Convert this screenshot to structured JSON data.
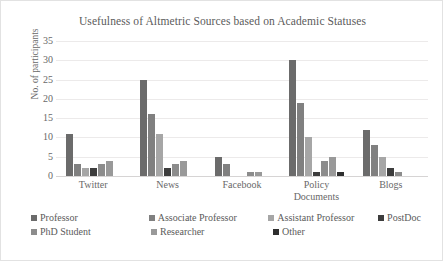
{
  "chart_data": {
    "type": "bar",
    "title": "Usefulness of Altmetric Sources based on Academic Statuses",
    "xlabel": "",
    "ylabel": "No. of participants",
    "ylim": [
      0,
      35
    ],
    "ytick_step": 5,
    "yticks": [
      "0",
      "5",
      "10",
      "15",
      "20",
      "25",
      "30",
      "35"
    ],
    "grid": true,
    "legend_position": "bottom",
    "categories": [
      "Twitter",
      "News",
      "Facebook",
      "Policy Documents",
      "Blogs"
    ],
    "category_lines": [
      [
        "Twitter"
      ],
      [
        "News"
      ],
      [
        "Facebook"
      ],
      [
        "Policy",
        "Documents"
      ],
      [
        "Blogs"
      ]
    ],
    "series": [
      {
        "name": "Professor",
        "color": "#6b6b6b",
        "values": [
          11,
          25,
          5,
          30,
          12
        ]
      },
      {
        "name": "Associate Professor",
        "color": "#808080",
        "values": [
          3,
          16,
          3,
          19,
          8
        ]
      },
      {
        "name": "Assistant Professor",
        "color": "#a6a6a6",
        "values": [
          2,
          11,
          0,
          10,
          5
        ]
      },
      {
        "name": "PostDoc",
        "color": "#3d3d3d",
        "values": [
          2,
          2,
          0,
          1,
          2
        ]
      },
      {
        "name": "PhD Student",
        "color": "#8c8c8c",
        "values": [
          3,
          3,
          1,
          4,
          1
        ]
      },
      {
        "name": "Researcher",
        "color": "#999999",
        "values": [
          4,
          4,
          1,
          5,
          0
        ]
      },
      {
        "name": "Other",
        "color": "#2e2e2e",
        "values": [
          0,
          0,
          0,
          1,
          0
        ]
      }
    ]
  },
  "legend_rows": [
    [
      "Professor",
      "Associate Professor",
      "Assistant Professor",
      "PostDoc"
    ],
    [
      "PhD Student",
      "Researcher",
      "Other"
    ]
  ],
  "colors": {
    "plot_background": "#ffffff",
    "gridline": "#eceaea",
    "axis_text": "#686868",
    "title_text": "#5b5b5b",
    "card_border": "#e2e2e2"
  }
}
